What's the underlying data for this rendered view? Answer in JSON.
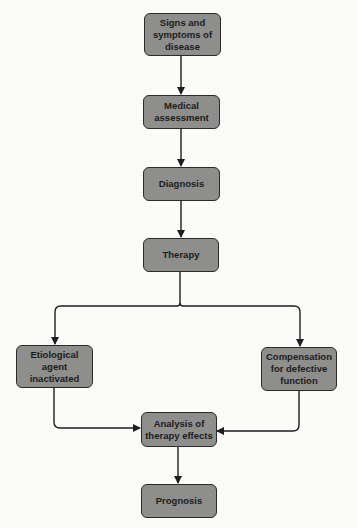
{
  "diagram": {
    "type": "flowchart",
    "nodes": [
      {
        "id": "signs",
        "label": "Signs and symptoms of disease"
      },
      {
        "id": "assessment",
        "label": "Medical assessment"
      },
      {
        "id": "diagnosis",
        "label": "Diagnosis"
      },
      {
        "id": "therapy",
        "label": "Therapy"
      },
      {
        "id": "etiological",
        "label": "Etiological agent inactivated"
      },
      {
        "id": "compensation",
        "label": "Compensation for defective function"
      },
      {
        "id": "analysis",
        "label": "Analysis of therapy effects"
      },
      {
        "id": "prognosis",
        "label": "Prognosis"
      }
    ],
    "edges": [
      [
        "signs",
        "assessment"
      ],
      [
        "assessment",
        "diagnosis"
      ],
      [
        "diagnosis",
        "therapy"
      ],
      [
        "therapy",
        "etiological"
      ],
      [
        "therapy",
        "compensation"
      ],
      [
        "etiological",
        "analysis"
      ],
      [
        "compensation",
        "analysis"
      ],
      [
        "analysis",
        "prognosis"
      ]
    ],
    "colors": {
      "node_fill": "#8e8e8c",
      "node_border": "#2a2a2a",
      "line": "#1e1e1e",
      "background": "#fbfbf9"
    }
  }
}
